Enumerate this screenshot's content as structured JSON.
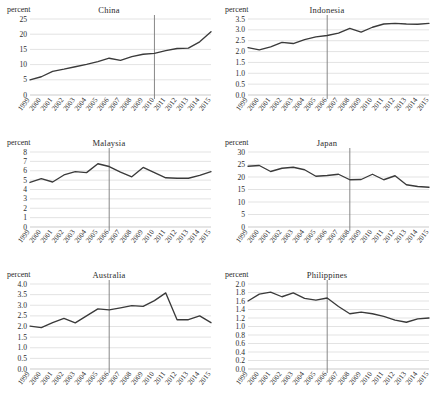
{
  "figure": {
    "unit_label": "percent",
    "x_categories": [
      "1999",
      "2000",
      "2001",
      "2002",
      "2003",
      "2004",
      "2005",
      "2006",
      "2007",
      "2008",
      "2009",
      "2010",
      "2011",
      "2012",
      "2013",
      "2014",
      "2015"
    ],
    "line_color": "#3a3a3a",
    "gridline_color": "#d0d0d0",
    "vline_color": "#7a7a7a",
    "panel_order": [
      "china",
      "indonesia",
      "malaysia",
      "japan",
      "australia",
      "philippines"
    ]
  },
  "chart_data": [
    {
      "type": "line",
      "title": "China",
      "xlabel": "",
      "ylabel": "percent",
      "ylim": [
        0,
        25
      ],
      "yticks": [
        0,
        5,
        10,
        15,
        20,
        25
      ],
      "ytick_labels": [
        "0",
        "5",
        "10",
        "15",
        "20",
        "25"
      ],
      "grid": true,
      "legend": "none",
      "x": [
        "1999",
        "2000",
        "2001",
        "2002",
        "2003",
        "2004",
        "2005",
        "2006",
        "2007",
        "2008",
        "2009",
        "2010",
        "2011",
        "2012",
        "2013",
        "2014",
        "2015"
      ],
      "values": [
        5.0,
        6.0,
        7.8,
        8.5,
        9.3,
        10.1,
        11.0,
        12.1,
        11.4,
        12.6,
        13.4,
        13.7,
        14.6,
        15.3,
        15.4,
        17.5,
        20.8
      ],
      "annotation_vline_year": "2010"
    },
    {
      "type": "line",
      "title": "Indonesia",
      "xlabel": "",
      "ylabel": "percent",
      "ylim": [
        0.0,
        3.5
      ],
      "yticks": [
        0.0,
        0.5,
        1.0,
        1.5,
        2.0,
        2.5,
        3.0,
        3.5
      ],
      "ytick_labels": [
        "0.0",
        "0.5",
        "1.0",
        "1.5",
        "2.0",
        "2.5",
        "3.0",
        "3.5"
      ],
      "grid": true,
      "legend": "none",
      "x": [
        "1999",
        "2000",
        "2001",
        "2002",
        "2003",
        "2004",
        "2005",
        "2006",
        "2007",
        "2008",
        "2009",
        "2010",
        "2011",
        "2012",
        "2013",
        "2014",
        "2015"
      ],
      "values": [
        2.18,
        2.08,
        2.22,
        2.42,
        2.37,
        2.55,
        2.68,
        2.74,
        2.85,
        3.07,
        2.9,
        3.12,
        3.27,
        3.3,
        3.27,
        3.26,
        3.3
      ],
      "annotation_vline_year": "2006"
    },
    {
      "type": "line",
      "title": "Malaysia",
      "xlabel": "",
      "ylabel": "percent",
      "ylim": [
        0,
        8
      ],
      "yticks": [
        0,
        1,
        2,
        3,
        4,
        5,
        6,
        7,
        8
      ],
      "ytick_labels": [
        "0",
        "1",
        "2",
        "3",
        "4",
        "5",
        "6",
        "7",
        "8"
      ],
      "grid": true,
      "legend": "none",
      "x": [
        "1999",
        "2000",
        "2001",
        "2002",
        "2003",
        "2004",
        "2005",
        "2006",
        "2007",
        "2008",
        "2009",
        "2010",
        "2011",
        "2012",
        "2013",
        "2014",
        "2015"
      ],
      "values": [
        4.75,
        5.15,
        4.8,
        5.55,
        5.9,
        5.8,
        6.75,
        6.45,
        5.85,
        5.35,
        6.35,
        5.8,
        5.25,
        5.2,
        5.2,
        5.5,
        5.9
      ],
      "annotation_vline_year": "2006"
    },
    {
      "type": "line",
      "title": "Japan",
      "xlabel": "",
      "ylabel": "percent",
      "ylim": [
        0,
        30
      ],
      "yticks": [
        0,
        5,
        10,
        15,
        20,
        25,
        30
      ],
      "ytick_labels": [
        "0",
        "5",
        "10",
        "15",
        "20",
        "25",
        "30"
      ],
      "grid": true,
      "legend": "none",
      "x": [
        "1999",
        "2000",
        "2001",
        "2002",
        "2003",
        "2004",
        "2005",
        "2006",
        "2007",
        "2008",
        "2009",
        "2010",
        "2011",
        "2012",
        "2013",
        "2014",
        "2015"
      ],
      "values": [
        24.3,
        24.6,
        22.2,
        23.5,
        23.9,
        22.9,
        20.3,
        20.6,
        21.1,
        18.9,
        19.0,
        21.1,
        18.9,
        20.5,
        16.9,
        16.2,
        15.9
      ],
      "annotation_vline_year": "2008"
    },
    {
      "type": "line",
      "title": "Australia",
      "xlabel": "",
      "ylabel": "percent",
      "ylim": [
        0.0,
        4.0
      ],
      "yticks": [
        0.0,
        0.5,
        1.0,
        1.5,
        2.0,
        2.5,
        3.0,
        3.5,
        4.0
      ],
      "ytick_labels": [
        "0.0",
        "0.5",
        "1.0",
        "1.5",
        "2.0",
        "2.5",
        "3.0",
        "3.5",
        "4.0"
      ],
      "grid": true,
      "legend": "none",
      "x": [
        "1999",
        "2000",
        "2001",
        "2002",
        "2003",
        "2004",
        "2005",
        "2006",
        "2007",
        "2008",
        "2009",
        "2010",
        "2011",
        "2012",
        "2013",
        "2014",
        "2015"
      ],
      "values": [
        2.02,
        1.95,
        2.18,
        2.38,
        2.17,
        2.5,
        2.83,
        2.78,
        2.88,
        2.98,
        2.95,
        3.22,
        3.58,
        2.32,
        2.32,
        2.5,
        2.18
      ],
      "annotation_vline_year": "2006"
    },
    {
      "type": "line",
      "title": "Philippines",
      "xlabel": "",
      "ylabel": "percent",
      "ylim": [
        0.0,
        2.0
      ],
      "yticks": [
        0.0,
        0.2,
        0.4,
        0.6,
        0.8,
        1.0,
        1.2,
        1.4,
        1.6,
        1.8,
        2.0
      ],
      "ytick_labels": [
        "0.0",
        "0.2",
        "0.4",
        "0.6",
        "0.8",
        "1.0",
        "1.2",
        "1.4",
        "1.6",
        "1.8",
        "2.0"
      ],
      "grid": true,
      "legend": "none",
      "x": [
        "1999",
        "2000",
        "2001",
        "2002",
        "2003",
        "2004",
        "2005",
        "2006",
        "2007",
        "2008",
        "2009",
        "2010",
        "2011",
        "2012",
        "2013",
        "2014",
        "2015"
      ],
      "values": [
        1.6,
        1.76,
        1.81,
        1.7,
        1.79,
        1.66,
        1.62,
        1.67,
        1.47,
        1.3,
        1.34,
        1.3,
        1.24,
        1.15,
        1.1,
        1.18,
        1.2
      ],
      "annotation_vline_year": "2006"
    }
  ]
}
